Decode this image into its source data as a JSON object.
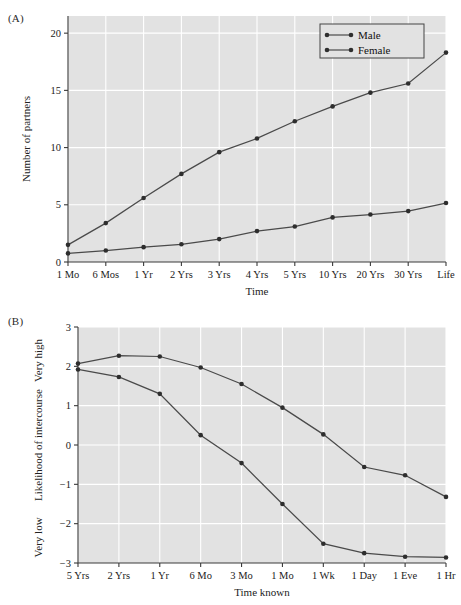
{
  "figure": {
    "panel_a_label": "(A)",
    "panel_b_label": "(B)"
  },
  "chart_data": [
    {
      "id": "panel_a",
      "type": "line",
      "title": "",
      "panel": "(A)",
      "xlabel": "Time",
      "ylabel": "Number of partners",
      "categories": [
        "1 Mo",
        "6 Mos",
        "1 Yr",
        "2 Yrs",
        "3 Yrs",
        "4 Yrs",
        "5 Yrs",
        "10 Yrs",
        "20 Yrs",
        "30 Yrs",
        "Life"
      ],
      "yticks": [
        0,
        5,
        10,
        15,
        20
      ],
      "ylim": [
        0,
        21.5
      ],
      "grid": true,
      "legend_position": "top-right",
      "series": [
        {
          "name": "Male",
          "values": [
            1.5,
            3.4,
            5.6,
            7.7,
            9.6,
            10.8,
            12.3,
            13.6,
            14.8,
            15.6,
            18.3
          ]
        },
        {
          "name": "Female",
          "values": [
            0.75,
            1.0,
            1.3,
            1.55,
            2.0,
            2.7,
            3.1,
            3.9,
            4.15,
            4.45,
            5.15
          ]
        }
      ]
    },
    {
      "id": "panel_b",
      "type": "line",
      "title": "",
      "panel": "(B)",
      "xlabel": "Time known",
      "ylabel": "Likelihood of intercourse",
      "ylabel_high": "Very high",
      "ylabel_low": "Very low",
      "categories": [
        "5 Yrs",
        "2 Yrs",
        "1 Yr",
        "6 Mo",
        "3 Mo",
        "1 Mo",
        "1 Wk",
        "1 Day",
        "1 Eve",
        "1 Hr"
      ],
      "yticks": [
        3,
        2,
        1,
        0,
        -1,
        -2,
        -3
      ],
      "ylim": [
        -3,
        3
      ],
      "grid": true,
      "legend_position": "none",
      "series": [
        {
          "name": "Male",
          "values": [
            2.07,
            2.27,
            2.25,
            1.97,
            1.55,
            0.95,
            0.27,
            -0.56,
            -0.77,
            -1.32
          ]
        },
        {
          "name": "Female",
          "values": [
            1.92,
            1.73,
            1.3,
            0.25,
            -0.46,
            -1.5,
            -2.51,
            -2.75,
            -2.84,
            -2.86
          ]
        }
      ]
    }
  ]
}
